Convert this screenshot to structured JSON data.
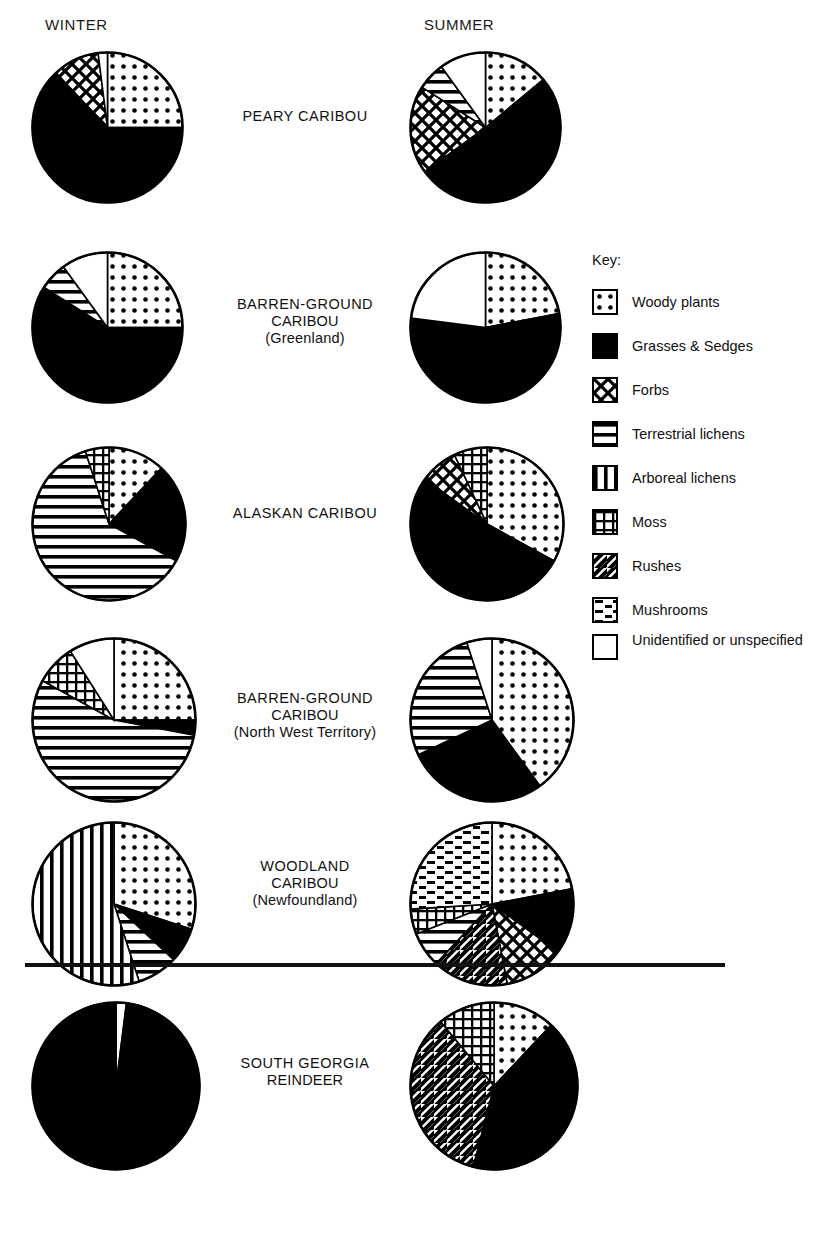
{
  "figure": {
    "top_partial_text": "",
    "columns": [
      {
        "id": "winter",
        "label": "WINTER"
      },
      {
        "id": "summer",
        "label": "SUMMER"
      }
    ],
    "divider_present": true
  },
  "key": {
    "title": "Key:",
    "items": [
      {
        "id": "woody",
        "label": "Woody plants",
        "pattern": "dots"
      },
      {
        "id": "grasses",
        "label": "Grasses & Sedges",
        "pattern": "solid"
      },
      {
        "id": "forbs",
        "label": "Forbs",
        "pattern": "crosshatch"
      },
      {
        "id": "terr_lichens",
        "label": "Terrestrial lichens",
        "pattern": "horizontal"
      },
      {
        "id": "arb_lichens",
        "label": "Arboreal lichens",
        "pattern": "vertical"
      },
      {
        "id": "moss",
        "label": "Moss",
        "pattern": "grid"
      },
      {
        "id": "rushes",
        "label": "Rushes",
        "pattern": "diagonal"
      },
      {
        "id": "mushrooms",
        "label": "Mushrooms",
        "pattern": "dashes"
      },
      {
        "id": "unidentified",
        "label": "Unidentified or unspecified",
        "pattern": "blank"
      }
    ]
  },
  "chart_data": {
    "type": "pie",
    "units": "percent of diet",
    "legend_position": "right",
    "categories": [
      "Woody plants",
      "Grasses & Sedges",
      "Forbs",
      "Terrestrial lichens",
      "Arboreal lichens",
      "Moss",
      "Rushes",
      "Mushrooms",
      "Unidentified or unspecified"
    ],
    "seasons": [
      "WINTER",
      "SUMMER"
    ],
    "charts": [
      {
        "name": "PEARY CARIBOU",
        "label_lines": [
          "PEARY CARIBOU"
        ],
        "winter": {
          "slices": [
            {
              "category": "Woody plants",
              "pattern": "dots",
              "value": 25
            },
            {
              "category": "Grasses & Sedges",
              "pattern": "solid",
              "value": 63
            },
            {
              "category": "Forbs",
              "pattern": "crosshatch",
              "value": 10
            },
            {
              "category": "Unidentified or unspecified",
              "pattern": "blank",
              "value": 2
            }
          ]
        },
        "summer": {
          "slices": [
            {
              "category": "Woody plants",
              "pattern": "dots",
              "value": 14
            },
            {
              "category": "Grasses & Sedges",
              "pattern": "solid",
              "value": 51
            },
            {
              "category": "Forbs",
              "pattern": "crosshatch",
              "value": 19
            },
            {
              "category": "Terrestrial lichens",
              "pattern": "horizontal",
              "value": 6
            },
            {
              "category": "Unidentified or unspecified",
              "pattern": "blank",
              "value": 10
            }
          ]
        }
      },
      {
        "name": "BARREN-GROUND CARIBOU (Greenland)",
        "label_lines": [
          "BARREN-GROUND",
          "CARIBOU",
          "(Greenland)"
        ],
        "winter": {
          "slices": [
            {
              "category": "Woody plants",
              "pattern": "dots",
              "value": 25
            },
            {
              "category": "Grasses & Sedges",
              "pattern": "solid",
              "value": 59
            },
            {
              "category": "Terrestrial lichens",
              "pattern": "horizontal",
              "value": 6
            },
            {
              "category": "Unidentified or unspecified",
              "pattern": "blank",
              "value": 10
            }
          ]
        },
        "summer": {
          "slices": [
            {
              "category": "Woody plants",
              "pattern": "dots",
              "value": 22
            },
            {
              "category": "Grasses & Sedges",
              "pattern": "solid",
              "value": 55
            },
            {
              "category": "Unidentified or unspecified",
              "pattern": "blank",
              "value": 23
            }
          ]
        }
      },
      {
        "name": "ALASKAN CARIBOU",
        "label_lines": [
          "ALASKAN CARIBOU"
        ],
        "winter": {
          "slices": [
            {
              "category": "Woody plants",
              "pattern": "dots",
              "value": 12
            },
            {
              "category": "Grasses & Sedges",
              "pattern": "solid",
              "value": 21
            },
            {
              "category": "Terrestrial lichens",
              "pattern": "horizontal",
              "value": 62
            },
            {
              "category": "Moss",
              "pattern": "grid",
              "value": 5
            }
          ]
        },
        "summer": {
          "slices": [
            {
              "category": "Woody plants",
              "pattern": "dots",
              "value": 33
            },
            {
              "category": "Grasses & Sedges",
              "pattern": "solid",
              "value": 52
            },
            {
              "category": "Forbs",
              "pattern": "crosshatch",
              "value": 8
            },
            {
              "category": "Moss",
              "pattern": "grid",
              "value": 7
            }
          ]
        }
      },
      {
        "name": "BARREN-GROUND CARIBOU (North West Territory)",
        "label_lines": [
          "BARREN-GROUND",
          "CARIBOU",
          "(North West Territory)"
        ],
        "winter": {
          "slices": [
            {
              "category": "Woody plants",
              "pattern": "dots",
              "value": 25
            },
            {
              "category": "Grasses & Sedges",
              "pattern": "solid",
              "value": 3
            },
            {
              "category": "Terrestrial lichens",
              "pattern": "horizontal",
              "value": 55
            },
            {
              "category": "Moss",
              "pattern": "grid",
              "value": 8
            },
            {
              "category": "Unidentified or unspecified",
              "pattern": "blank",
              "value": 9
            }
          ]
        },
        "summer": {
          "slices": [
            {
              "category": "Woody plants",
              "pattern": "dots",
              "value": 40
            },
            {
              "category": "Grasses & Sedges",
              "pattern": "solid",
              "value": 28
            },
            {
              "category": "Terrestrial lichens",
              "pattern": "horizontal",
              "value": 27
            },
            {
              "category": "Unidentified or unspecified",
              "pattern": "blank",
              "value": 5
            }
          ]
        }
      },
      {
        "name": "WOODLAND CARIBOU (Newfoundland)",
        "label_lines": [
          "WOODLAND",
          "CARIBOU",
          "(Newfoundland)"
        ],
        "winter": {
          "slices": [
            {
              "category": "Woody plants",
              "pattern": "dots",
              "value": 30
            },
            {
              "category": "Grasses & Sedges",
              "pattern": "solid",
              "value": 7
            },
            {
              "category": "Terrestrial lichens",
              "pattern": "horizontal",
              "value": 8
            },
            {
              "category": "Arboreal lichens",
              "pattern": "vertical",
              "value": 55
            }
          ]
        },
        "summer": {
          "slices": [
            {
              "category": "Woody plants",
              "pattern": "dots",
              "value": 22
            },
            {
              "category": "Grasses & Sedges",
              "pattern": "solid",
              "value": 13
            },
            {
              "category": "Forbs",
              "pattern": "crosshatch",
              "value": 12
            },
            {
              "category": "Rushes",
              "pattern": "diagonal",
              "value": 15
            },
            {
              "category": "Terrestrial lichens",
              "pattern": "horizontal",
              "value": 7
            },
            {
              "category": "Moss",
              "pattern": "grid",
              "value": 5
            },
            {
              "category": "Mushrooms",
              "pattern": "dashes",
              "value": 26
            }
          ]
        }
      },
      {
        "name": "SOUTH GEORGIA REINDEER",
        "label_lines": [
          "SOUTH GEORGIA",
          "REINDEER"
        ],
        "winter": {
          "slices": [
            {
              "category": "Unidentified or unspecified",
              "pattern": "blank",
              "value": 2
            },
            {
              "category": "Grasses & Sedges",
              "pattern": "solid",
              "value": 98
            }
          ]
        },
        "summer": {
          "slices": [
            {
              "category": "Woody plants",
              "pattern": "dots",
              "value": 12
            },
            {
              "category": "Grasses & Sedges",
              "pattern": "solid",
              "value": 42
            },
            {
              "category": "Rushes",
              "pattern": "diagonal",
              "value": 35
            },
            {
              "category": "Moss",
              "pattern": "grid",
              "value": 11
            }
          ]
        }
      }
    ]
  },
  "colors": {
    "ink": "#000000",
    "background": "#ffffff"
  }
}
